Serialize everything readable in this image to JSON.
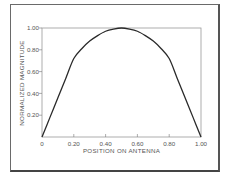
{
  "chart_data": {
    "type": "line",
    "title": "",
    "xlabel": "POSITION ON ANTENNA",
    "ylabel": "NORMALIZED MAGNITUDE",
    "xlim": [
      0,
      1.0
    ],
    "ylim": [
      0,
      1.0
    ],
    "x_ticks": [
      "0",
      "0.20",
      "0.40",
      "0.60",
      "0.80",
      "1.00"
    ],
    "y_ticks": [
      "0.20",
      "0.40",
      "0.60",
      "0.80",
      "1.00"
    ],
    "grid": false,
    "legend": null,
    "series": [
      {
        "name": "current distribution",
        "x": [
          0,
          0.05,
          0.1,
          0.15,
          0.2,
          0.25,
          0.3,
          0.35,
          0.4,
          0.45,
          0.5,
          0.55,
          0.6,
          0.65,
          0.7,
          0.75,
          0.8,
          0.85,
          0.9,
          0.95,
          1.0
        ],
        "y": [
          0,
          0.18,
          0.36,
          0.54,
          0.72,
          0.81,
          0.88,
          0.93,
          0.97,
          0.99,
          1.0,
          0.99,
          0.97,
          0.93,
          0.88,
          0.81,
          0.72,
          0.54,
          0.36,
          0.18,
          0
        ]
      }
    ]
  }
}
